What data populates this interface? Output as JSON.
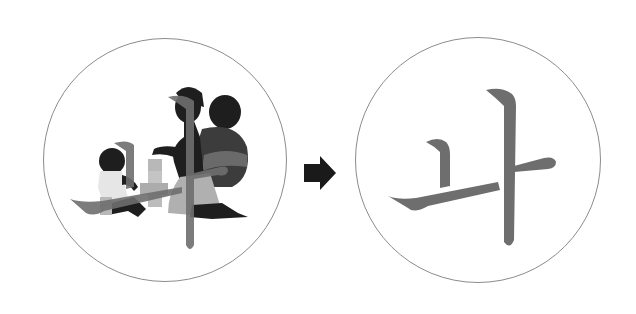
{
  "diagram": {
    "type": "before-after illustration",
    "left": {
      "description": "Mother kneeling with child on back, playing blocks with a toddler, overlaid by Korean character",
      "character": "나",
      "circle_stroke": "#8c8c8c"
    },
    "arrow": {
      "direction": "right",
      "color": "#1a1a1a"
    },
    "right": {
      "description": "Korean character alone",
      "character": "나",
      "circle_stroke": "#8c8c8c"
    },
    "colors": {
      "character": "#6e6e6e",
      "silhouette": "#1e1e1e",
      "clothing": "#9a9a9a",
      "background": "#ffffff"
    }
  }
}
